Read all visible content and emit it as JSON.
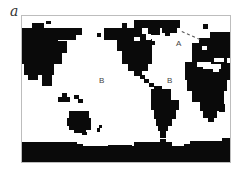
{
  "figure": {
    "panel_label": "a",
    "frame_color": "#bdbdbd",
    "land_color": "#0a0a0a",
    "ocean_color": "#ffffff"
  },
  "labels": [
    {
      "text": "A",
      "x": 154,
      "y": 24
    },
    {
      "text": "B",
      "x": 77,
      "y": 61
    },
    {
      "text": "B",
      "x": 145,
      "y": 61
    }
  ],
  "dashed_line": {
    "x1": 160,
    "y1": 15,
    "x2": 178,
    "y2": 23
  },
  "land": [
    {
      "x": 0,
      "y": 12,
      "w": 36,
      "h": 14
    },
    {
      "x": 10,
      "y": 7,
      "w": 12,
      "h": 6
    },
    {
      "x": 24,
      "y": 5,
      "w": 5,
      "h": 3
    },
    {
      "x": 36,
      "y": 12,
      "w": 24,
      "h": 7
    },
    {
      "x": 36,
      "y": 18,
      "w": 18,
      "h": 6
    },
    {
      "x": 0,
      "y": 25,
      "w": 45,
      "h": 12
    },
    {
      "x": 0,
      "y": 36,
      "w": 40,
      "h": 12
    },
    {
      "x": 2,
      "y": 47,
      "w": 30,
      "h": 12
    },
    {
      "x": 6,
      "y": 58,
      "w": 10,
      "h": 6
    },
    {
      "x": 20,
      "y": 58,
      "w": 10,
      "h": 12
    },
    {
      "x": 75,
      "y": 17,
      "w": 4,
      "h": 4
    },
    {
      "x": 82,
      "y": 12,
      "w": 40,
      "h": 12
    },
    {
      "x": 100,
      "y": 7,
      "w": 5,
      "h": 6
    },
    {
      "x": 95,
      "y": 23,
      "w": 35,
      "h": 12
    },
    {
      "x": 100,
      "y": 34,
      "w": 30,
      "h": 14
    },
    {
      "x": 106,
      "y": 47,
      "w": 20,
      "h": 8
    },
    {
      "x": 112,
      "y": 54,
      "w": 8,
      "h": 6
    },
    {
      "x": 118,
      "y": 59,
      "w": 5,
      "h": 4
    },
    {
      "x": 122,
      "y": 63,
      "w": 5,
      "h": 4
    },
    {
      "x": 127,
      "y": 67,
      "w": 5,
      "h": 4
    },
    {
      "x": 132,
      "y": 70,
      "w": 8,
      "h": 4
    },
    {
      "x": 120,
      "y": 4,
      "w": 38,
      "h": 8
    },
    {
      "x": 112,
      "y": 4,
      "w": 8,
      "h": 8
    },
    {
      "x": 118,
      "y": 11,
      "w": 10,
      "h": 18
    },
    {
      "x": 128,
      "y": 11,
      "w": 10,
      "h": 8
    },
    {
      "x": 140,
      "y": 11,
      "w": 15,
      "h": 6
    },
    {
      "x": 143,
      "y": 16,
      "w": 5,
      "h": 4
    },
    {
      "x": 129,
      "y": 25,
      "w": 4,
      "h": 4
    },
    {
      "x": 181,
      "y": 8,
      "w": 5,
      "h": 5
    },
    {
      "x": 188,
      "y": 16,
      "w": 22,
      "h": 6
    },
    {
      "x": 177,
      "y": 22,
      "w": 33,
      "h": 6
    },
    {
      "x": 170,
      "y": 27,
      "w": 40,
      "h": 20
    },
    {
      "x": 163,
      "y": 46,
      "w": 47,
      "h": 18
    },
    {
      "x": 165,
      "y": 63,
      "w": 40,
      "h": 12
    },
    {
      "x": 170,
      "y": 74,
      "w": 32,
      "h": 12
    },
    {
      "x": 178,
      "y": 85,
      "w": 24,
      "h": 10
    },
    {
      "x": 181,
      "y": 94,
      "w": 14,
      "h": 8
    },
    {
      "x": 186,
      "y": 101,
      "w": 6,
      "h": 5
    },
    {
      "x": 197,
      "y": 88,
      "w": 6,
      "h": 8
    },
    {
      "x": 129,
      "y": 73,
      "w": 20,
      "h": 12
    },
    {
      "x": 129,
      "y": 84,
      "w": 28,
      "h": 10
    },
    {
      "x": 132,
      "y": 93,
      "w": 22,
      "h": 10
    },
    {
      "x": 134,
      "y": 102,
      "w": 16,
      "h": 8
    },
    {
      "x": 136,
      "y": 109,
      "w": 10,
      "h": 6
    },
    {
      "x": 138,
      "y": 114,
      "w": 6,
      "h": 8
    },
    {
      "x": 36,
      "y": 81,
      "w": 12,
      "h": 5
    },
    {
      "x": 40,
      "y": 77,
      "w": 5,
      "h": 4
    },
    {
      "x": 52,
      "y": 79,
      "w": 5,
      "h": 4
    },
    {
      "x": 56,
      "y": 83,
      "w": 5,
      "h": 4
    },
    {
      "x": 47,
      "y": 95,
      "w": 20,
      "h": 8
    },
    {
      "x": 45,
      "y": 102,
      "w": 24,
      "h": 8
    },
    {
      "x": 47,
      "y": 109,
      "w": 22,
      "h": 5
    },
    {
      "x": 52,
      "y": 113,
      "w": 12,
      "h": 4
    },
    {
      "x": 60,
      "y": 116,
      "w": 5,
      "h": 3
    },
    {
      "x": 77,
      "y": 109,
      "w": 3,
      "h": 3
    },
    {
      "x": 75,
      "y": 112,
      "w": 3,
      "h": 4
    },
    {
      "x": 0,
      "y": 130,
      "w": 210,
      "h": 18
    },
    {
      "x": 0,
      "y": 126,
      "w": 55,
      "h": 5
    },
    {
      "x": 55,
      "y": 128,
      "w": 6,
      "h": 3
    },
    {
      "x": 86,
      "y": 129,
      "w": 24,
      "h": 2
    },
    {
      "x": 112,
      "y": 126,
      "w": 24,
      "h": 5
    },
    {
      "x": 138,
      "y": 123,
      "w": 6,
      "h": 4
    },
    {
      "x": 136,
      "y": 126,
      "w": 14,
      "h": 4
    },
    {
      "x": 162,
      "y": 128,
      "w": 6,
      "h": 3
    },
    {
      "x": 168,
      "y": 125,
      "w": 42,
      "h": 6
    },
    {
      "x": 200,
      "y": 122,
      "w": 10,
      "h": 4
    }
  ],
  "holes": [
    {
      "x": 120,
      "y": 12,
      "w": 6,
      "h": 6
    },
    {
      "x": 124,
      "y": 18,
      "w": 5,
      "h": 6
    },
    {
      "x": 112,
      "y": 21,
      "w": 6,
      "h": 4
    },
    {
      "x": 175,
      "y": 46,
      "w": 14,
      "h": 5
    },
    {
      "x": 181,
      "y": 48,
      "w": 18,
      "h": 5
    },
    {
      "x": 192,
      "y": 42,
      "w": 10,
      "h": 4
    },
    {
      "x": 205,
      "y": 42,
      "w": 5,
      "h": 5
    },
    {
      "x": 180,
      "y": 30,
      "w": 5,
      "h": 4
    },
    {
      "x": 191,
      "y": 52,
      "w": 6,
      "h": 4
    }
  ]
}
